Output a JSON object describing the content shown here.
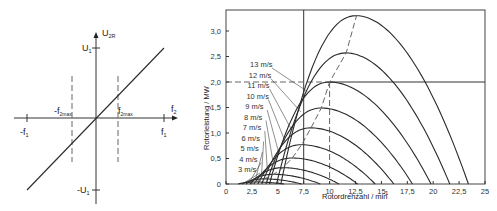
{
  "left_diagram": {
    "y_axis_label": "U",
    "y_axis_label_sub": "2R",
    "x_axis_label": "f",
    "x_axis_label_sub": "2",
    "labels": {
      "u1": {
        "main": "U",
        "sub": "1"
      },
      "neg_u1": {
        "main": "-U",
        "sub": "1"
      },
      "f1": {
        "main": "f",
        "sub": "1"
      },
      "neg_f1": {
        "main": "-f",
        "sub": "1"
      },
      "f2max": {
        "main": "f",
        "sub": "2max"
      },
      "neg_f2max": {
        "main": "-f",
        "sub": "2max"
      }
    }
  },
  "chart_data": [
    {
      "type": "line",
      "title": "",
      "description": "Linear relation U2R proportional to f2 with limits ±f2max",
      "xlabel": "f2",
      "ylabel": "U2R",
      "x_ticks": [
        "-f1",
        "-f2max",
        "f2max",
        "f1"
      ],
      "y_ticks": [
        "U1",
        "-U1"
      ],
      "series": [
        {
          "name": "U2R(f2)",
          "x": [
            -1,
            1
          ],
          "y": [
            -1,
            1
          ]
        }
      ]
    },
    {
      "type": "line",
      "title": "",
      "xlabel": "Rotordrehzahl / min",
      "xlabel_superscript": "-1",
      "ylabel": "Rotorleistung / MW",
      "xlim": [
        0,
        25
      ],
      "ylim": [
        0,
        3.3
      ],
      "x_ticks": [
        "0",
        "2,5",
        "5",
        "7,5",
        "10",
        "12,5",
        "15",
        "17,5",
        "20",
        "22,5",
        "25"
      ],
      "y_ticks": [
        "0",
        "0,5",
        "1,0",
        "1,5",
        "2,0",
        "2,5",
        "3,0"
      ],
      "grid": false,
      "reference_lines": {
        "vertical_solid_x": 7.5,
        "horizontal_solid_y": 2.0,
        "vertical_dashed_x": 10,
        "horizontal_dashed_y": 2.0,
        "optimal_curve": "dashed line through maxima"
      },
      "series": [
        {
          "name": "3 m/s",
          "peak_x": 2.8,
          "peak_y": 0.04,
          "zero_x": 5.6
        },
        {
          "name": "4 m/s",
          "peak_x": 3.7,
          "peak_y": 0.1,
          "zero_x": 7.3
        },
        {
          "name": "5 m/s",
          "peak_x": 4.6,
          "peak_y": 0.19,
          "zero_x": 9.1
        },
        {
          "name": "6 m/s",
          "peak_x": 5.5,
          "peak_y": 0.32,
          "zero_x": 10.9
        },
        {
          "name": "7 m/s",
          "peak_x": 6.4,
          "peak_y": 0.51,
          "zero_x": 12.7
        },
        {
          "name": "8 m/s",
          "peak_x": 7.3,
          "peak_y": 0.77,
          "zero_x": 14.4
        },
        {
          "name": "9 m/s",
          "peak_x": 8.2,
          "peak_y": 1.1,
          "zero_x": 16.2
        },
        {
          "name": "10 m/s",
          "peak_x": 9.2,
          "peak_y": 1.49,
          "zero_x": 18.0
        },
        {
          "name": "11 m/s",
          "peak_x": 10.0,
          "peak_y": 2.0,
          "zero_x": 19.8
        },
        {
          "name": "12 m/s",
          "peak_x": 11.6,
          "peak_y": 2.57,
          "zero_x": 21.6
        },
        {
          "name": "13 m/s",
          "peak_x": 12.6,
          "peak_y": 3.3,
          "zero_x": 23.4
        }
      ]
    }
  ]
}
